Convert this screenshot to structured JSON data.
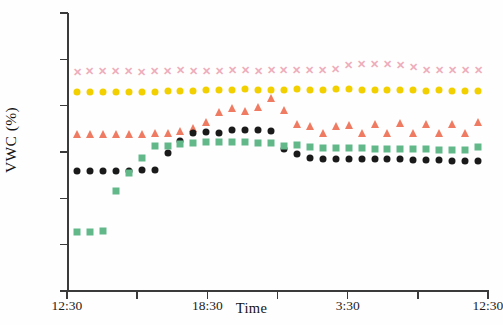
{
  "chart_data": {
    "type": "scatter",
    "title": "",
    "xlabel": "Time",
    "ylabel": "VWC (%)",
    "ylim": [
      5,
      35
    ],
    "ytick_values": [
      5,
      10,
      15,
      20,
      25,
      30,
      35
    ],
    "ytick_labels": [
      "5",
      "10",
      "15",
      "20",
      "25",
      "30",
      "35"
    ],
    "grid": false,
    "legend": "none",
    "x_is_time": true,
    "xtick_labels": [
      "12:30",
      "",
      "18:30",
      "",
      "3:30",
      "",
      "12:30"
    ],
    "xtick_labeled": [
      {
        "label": "12:30",
        "index": 0
      },
      {
        "label": "18:30",
        "index": 2
      },
      {
        "label": "3:30",
        "index": 4
      },
      {
        "label": "12:30",
        "index": 6
      }
    ],
    "n_points": 32,
    "series": [
      {
        "name": "pink-x-series",
        "marker": "x",
        "color": "#eeaebb",
        "values": [
          28.6,
          28.7,
          28.7,
          28.7,
          28.7,
          28.6,
          28.7,
          28.7,
          28.8,
          28.7,
          28.7,
          28.7,
          28.8,
          28.8,
          28.7,
          28.8,
          28.8,
          28.8,
          28.8,
          28.9,
          29.0,
          29.4,
          29.5,
          29.5,
          29.5,
          29.4,
          29.2,
          28.8,
          28.8,
          28.8,
          28.8,
          28.8
        ]
      },
      {
        "name": "yellow-circle-series",
        "marker": "circle",
        "color": "#f2d000",
        "values": [
          26.5,
          26.5,
          26.5,
          26.5,
          26.5,
          26.5,
          26.5,
          26.6,
          26.6,
          26.6,
          26.7,
          26.7,
          26.7,
          26.8,
          26.7,
          26.7,
          26.7,
          26.8,
          26.7,
          26.7,
          26.8,
          26.8,
          26.7,
          26.7,
          26.7,
          26.7,
          26.7,
          26.6,
          26.7,
          26.6,
          26.6,
          26.6
        ]
      },
      {
        "name": "red-triangle-series",
        "marker": "triangle",
        "color": "#ef7b62",
        "values": [
          21.9,
          21.9,
          21.9,
          21.9,
          21.9,
          21.9,
          22.0,
          22.1,
          22.3,
          22.6,
          23.2,
          24.3,
          24.7,
          24.4,
          24.9,
          25.8,
          24.5,
          23.0,
          22.8,
          22.0,
          22.8,
          22.9,
          22.0,
          23.0,
          22.0,
          23.1,
          22.1,
          23.0,
          22.1,
          23.0,
          22.1,
          23.2
        ]
      },
      {
        "name": "black-circle-series",
        "marker": "circle",
        "color": "#1a1a1a",
        "values": [
          18.0,
          18.0,
          18.0,
          18.0,
          18.0,
          18.1,
          18.1,
          19.9,
          21.2,
          22.0,
          22.2,
          22.1,
          22.4,
          22.4,
          22.4,
          22.3,
          20.3,
          19.8,
          19.3,
          19.2,
          19.2,
          19.2,
          19.2,
          19.2,
          19.2,
          19.2,
          19.1,
          19.1,
          19.1,
          19.0,
          19.0,
          19.0
        ]
      },
      {
        "name": "green-square-series",
        "marker": "square",
        "color": "#63b88a",
        "values": [
          11.4,
          11.4,
          11.5,
          15.8,
          17.7,
          19.3,
          20.7,
          20.6,
          20.9,
          21.0,
          21.1,
          21.1,
          21.1,
          21.1,
          21.0,
          21.0,
          20.6,
          20.8,
          20.5,
          20.4,
          20.4,
          20.4,
          20.4,
          20.3,
          20.3,
          20.3,
          20.3,
          20.3,
          20.2,
          20.2,
          20.2,
          20.5
        ]
      }
    ]
  }
}
